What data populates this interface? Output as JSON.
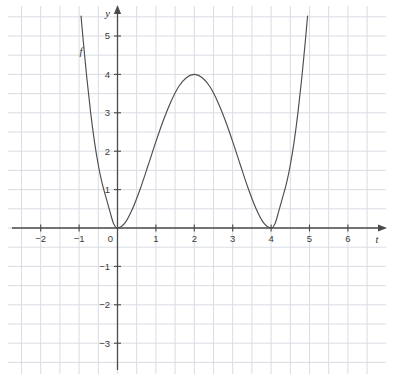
{
  "figure": {
    "background_color": "#ffffff",
    "grid_color": "#d8dde3",
    "axis_color": "#4a4a4a",
    "curve_color": "#4d4d4d",
    "label_color": "#3a3a3a"
  },
  "chart_data": {
    "type": "line",
    "title": "",
    "subtitle": "",
    "xlabel": "t",
    "ylabel": "y",
    "grid": true,
    "legend": "none",
    "series_label": "f",
    "series_label_position": {
      "t": -0.95,
      "y": 4.5
    },
    "xlim": [
      -2.85,
      7.0
    ],
    "ylim": [
      -3.85,
      6.55
    ],
    "x_ticks": [
      -2,
      -1,
      0,
      1,
      2,
      3,
      4,
      5,
      6
    ],
    "x_tick_labels": [
      "−2",
      "−1",
      "0",
      "1",
      "2",
      "3",
      "4",
      "5",
      "6"
    ],
    "y_ticks": [
      -3,
      -2,
      -1,
      1,
      2,
      3,
      4,
      5
    ],
    "y_tick_labels": [
      "−3",
      "−2",
      "−1",
      "1",
      "2",
      "3",
      "4",
      "5"
    ],
    "origin_label": "0",
    "x_gridlines": [
      -2.5,
      -1.5,
      -0.5,
      0.5,
      1.5,
      2.5,
      3.5,
      4.5,
      5.5,
      6.5
    ],
    "y_gridlines": [
      -3.5,
      -2.5,
      -1.5,
      -0.5,
      0.5,
      1.5,
      2.5,
      3.5,
      4.5,
      5.5,
      6.5
    ],
    "grid_spacing_units": 1,
    "x_axis_arrow": true,
    "y_axis_arrow": true,
    "function_expression": "f(t) = 0.25 * t^2 * (t - 4)^2",
    "roots": [
      {
        "t": 0,
        "y": 0,
        "multiplicity": 2
      },
      {
        "t": 4,
        "y": 0,
        "multiplicity": 2
      }
    ],
    "local_maximum": {
      "t": 2,
      "y": 4
    },
    "local_minima": [
      {
        "t": 0,
        "y": 0
      },
      {
        "t": 4,
        "y": 0
      }
    ],
    "series": [
      {
        "name": "f",
        "points": [
          {
            "t": -0.95,
            "y": 5.52
          },
          {
            "t": -0.9,
            "y": 4.96
          },
          {
            "t": -0.8,
            "y": 3.92
          },
          {
            "t": -0.7,
            "y": 3.01
          },
          {
            "t": -0.6,
            "y": 2.25
          },
          {
            "t": -0.5,
            "y": 1.64
          },
          {
            "t": -0.4,
            "y": 1.16
          },
          {
            "t": -0.3,
            "y": 0.8
          },
          {
            "t": -0.2,
            "y": 0.44
          },
          {
            "t": -0.1,
            "y": 0.11
          },
          {
            "t": 0.0,
            "y": 0.0
          },
          {
            "t": 0.2,
            "y": 0.14
          },
          {
            "t": 0.4,
            "y": 0.52
          },
          {
            "t": 0.6,
            "y": 1.04
          },
          {
            "t": 0.8,
            "y": 1.64
          },
          {
            "t": 1.0,
            "y": 2.25
          },
          {
            "t": 1.2,
            "y": 2.82
          },
          {
            "t": 1.4,
            "y": 3.31
          },
          {
            "t": 1.6,
            "y": 3.69
          },
          {
            "t": 1.8,
            "y": 3.92
          },
          {
            "t": 2.0,
            "y": 4.0
          },
          {
            "t": 2.2,
            "y": 3.92
          },
          {
            "t": 2.4,
            "y": 3.69
          },
          {
            "t": 2.6,
            "y": 3.31
          },
          {
            "t": 2.8,
            "y": 2.82
          },
          {
            "t": 3.0,
            "y": 2.25
          },
          {
            "t": 3.2,
            "y": 1.64
          },
          {
            "t": 3.4,
            "y": 1.04
          },
          {
            "t": 3.6,
            "y": 0.52
          },
          {
            "t": 3.8,
            "y": 0.14
          },
          {
            "t": 4.0,
            "y": 0.0
          },
          {
            "t": 4.1,
            "y": 0.11
          },
          {
            "t": 4.2,
            "y": 0.44
          },
          {
            "t": 4.3,
            "y": 0.8
          },
          {
            "t": 4.4,
            "y": 1.16
          },
          {
            "t": 4.5,
            "y": 1.64
          },
          {
            "t": 4.6,
            "y": 2.25
          },
          {
            "t": 4.7,
            "y": 3.01
          },
          {
            "t": 4.8,
            "y": 3.92
          },
          {
            "t": 4.9,
            "y": 4.96
          },
          {
            "t": 4.95,
            "y": 5.52
          }
        ]
      }
    ]
  },
  "geometry": {
    "origin_px": {
      "x": 117.5,
      "y": 228.0
    },
    "unit_px": 38.4,
    "grid_left_px": 8,
    "grid_right_px": 386,
    "grid_top_px": 6,
    "grid_bottom_px": 374
  }
}
